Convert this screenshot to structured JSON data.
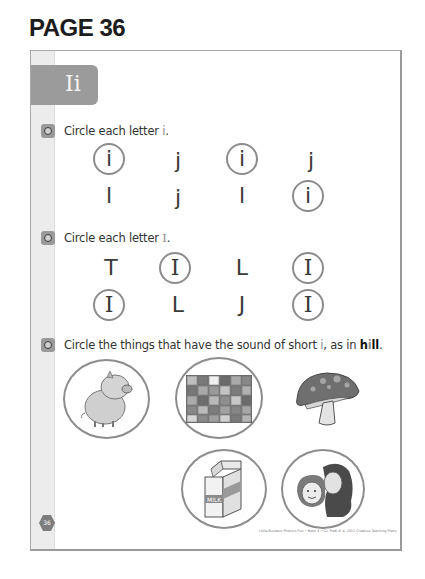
{
  "page": {
    "heading": "PAGE 36",
    "page_number": "36",
    "footer": "Little Builders Phonics Fun • Book 4 • Gr. PreK–K © 2012 Creative Teaching Press"
  },
  "header": {
    "tab_label": "Ii"
  },
  "sections": [
    {
      "instruction_prefix": "Circle each letter ",
      "instruction_highlight": "i",
      "instruction_suffix": ".",
      "rows": [
        [
          {
            "char": "i",
            "circled": true
          },
          {
            "char": "j",
            "circled": false
          },
          {
            "char": "i",
            "circled": true
          },
          {
            "char": "j",
            "circled": false
          }
        ],
        [
          {
            "char": "l",
            "circled": false
          },
          {
            "char": "j",
            "circled": false
          },
          {
            "char": "l",
            "circled": false
          },
          {
            "char": "i",
            "circled": true
          }
        ]
      ]
    },
    {
      "instruction_prefix": "Circle each letter ",
      "instruction_highlight": "I",
      "instruction_suffix": ".",
      "rows": [
        [
          {
            "char": "T",
            "circled": false
          },
          {
            "char": "I",
            "circled": true
          },
          {
            "char": "L",
            "circled": false
          },
          {
            "char": "I",
            "circled": true
          }
        ],
        [
          {
            "char": "I",
            "circled": true
          },
          {
            "char": "L",
            "circled": false
          },
          {
            "char": "J",
            "circled": false
          },
          {
            "char": "I",
            "circled": true
          }
        ]
      ]
    },
    {
      "instruction_prefix": "Circle the things that have the sound of short ",
      "instruction_highlight": "i",
      "instruction_mid": ", as in ",
      "instruction_bold_h": "h",
      "instruction_bold_i": "i",
      "instruction_bold_ll": "ll",
      "instruction_suffix": ".",
      "pictures": [
        {
          "name": "pig",
          "circled": true
        },
        {
          "name": "quilt",
          "circled": true
        },
        {
          "name": "mushroom",
          "circled": false
        },
        {
          "name": "milk carton",
          "circled": true,
          "label": "MILK"
        },
        {
          "name": "kiss",
          "circled": true
        }
      ]
    }
  ],
  "colors": {
    "tab": "#9b9b9b",
    "strip": "#ececec",
    "circle_stroke": "#8c8c8c",
    "frame_border": "#9a9a9a"
  }
}
